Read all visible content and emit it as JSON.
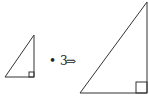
{
  "diagram": {
    "operator": "• 3",
    "scale_factor": 3,
    "arrow": "⇒",
    "small_triangle": {
      "points": [
        [
          5,
          77
        ],
        [
          34,
          35
        ],
        [
          34,
          77
        ]
      ],
      "right_angle_at": [
        34,
        77
      ]
    },
    "large_triangle": {
      "points": [
        [
          80,
          93
        ],
        [
          147,
          2
        ],
        [
          147,
          93
        ]
      ],
      "right_angle_at": [
        147,
        93
      ]
    },
    "stroke_color": "#333333"
  }
}
